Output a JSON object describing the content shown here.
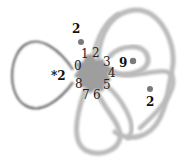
{
  "colors": {
    "band": "#b9b9b9",
    "disk": "#9e9e9e",
    "outline": "#555555",
    "puncture": "#7a7a7a",
    "text": "#222222"
  },
  "disk": {
    "boundary_labels": [
      "0",
      "1",
      "2",
      "3",
      "4",
      "5",
      "6",
      "7",
      "8"
    ]
  },
  "left_loop": {
    "label": "*2"
  },
  "punctures": [
    {
      "id": "top",
      "label": "2"
    },
    {
      "id": "inner",
      "label": "9"
    },
    {
      "id": "right",
      "label": "2"
    }
  ]
}
